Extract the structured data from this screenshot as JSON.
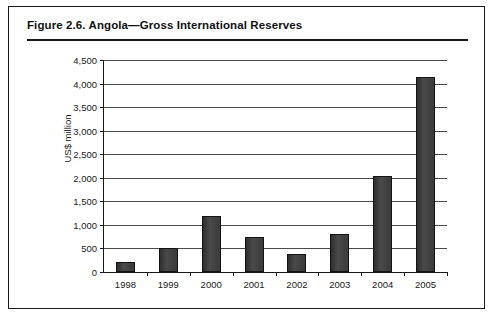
{
  "figure": {
    "title": "Figure 2.6.  Angola—Gross International Reserves"
  },
  "chart_data": {
    "type": "bar",
    "title": "Figure 2.6.  Angola—Gross International Reserves",
    "xlabel": "",
    "ylabel": "US$ million",
    "categories": [
      "1998",
      "1999",
      "2000",
      "2001",
      "2002",
      "2003",
      "2004",
      "2005"
    ],
    "values": [
      205,
      500,
      1185,
      740,
      375,
      810,
      2030,
      4150
    ],
    "ylim": [
      0,
      4500
    ],
    "ytick_step": 500,
    "ytick_labels": [
      "0",
      "500",
      "1,000",
      "1,500",
      "2,000",
      "2,500",
      "3,000",
      "3,500",
      "4,000",
      "4,500"
    ],
    "grid": true,
    "legend": false,
    "bar_color": "#3a3a3a",
    "axis_color": "#1a1a1a",
    "background": "#ffffff"
  }
}
